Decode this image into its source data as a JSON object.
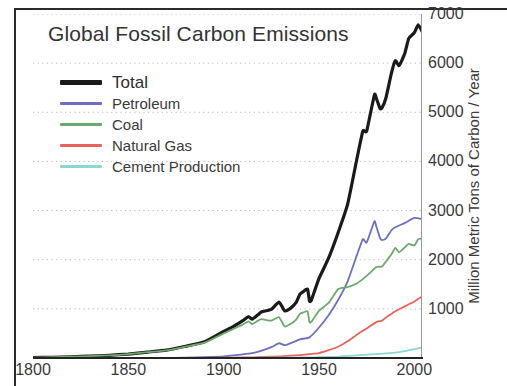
{
  "chart_data": {
    "type": "line",
    "title": "Global Fossil Carbon Emissions",
    "xlabel": "",
    "ylabel": "Million Metric Tons of Carbon / Year",
    "xlim": [
      1800,
      2004
    ],
    "ylim": [
      0,
      7000
    ],
    "xticks": [
      "1800",
      "1850",
      "1900",
      "1950",
      "2000"
    ],
    "xtick_values": [
      1800,
      1850,
      1900,
      1950,
      2000
    ],
    "yticks": [
      "1000",
      "2000",
      "3000",
      "4000",
      "5000",
      "6000",
      "7000"
    ],
    "ytick_values": [
      1000,
      2000,
      3000,
      4000,
      5000,
      6000,
      7000
    ],
    "grid": true,
    "grid_style": "dotted-horizontal",
    "yaxis_position": "right",
    "legend_position": "top-left",
    "series": [
      {
        "name": "Total",
        "color": "#1a1a1a",
        "width": 3.2,
        "x": [
          1800,
          1810,
          1820,
          1830,
          1840,
          1850,
          1860,
          1870,
          1880,
          1890,
          1900,
          1905,
          1910,
          1913,
          1915,
          1918,
          1920,
          1925,
          1929,
          1932,
          1935,
          1938,
          1940,
          1942,
          1944,
          1945,
          1946,
          1950,
          1955,
          1960,
          1965,
          1970,
          1973,
          1975,
          1979,
          1980,
          1982,
          1983,
          1985,
          1988,
          1990,
          1992,
          1995,
          1997,
          2000,
          2002,
          2004
        ],
        "y": [
          8,
          15,
          25,
          38,
          55,
          80,
          120,
          160,
          240,
          330,
          540,
          640,
          760,
          840,
          790,
          880,
          940,
          990,
          1140,
          960,
          1010,
          1130,
          1300,
          1360,
          1400,
          1160,
          1180,
          1620,
          2030,
          2550,
          3130,
          4080,
          4620,
          4620,
          5350,
          5290,
          5080,
          5090,
          5280,
          5800,
          6050,
          5950,
          6200,
          6500,
          6620,
          6780,
          6650
        ]
      },
      {
        "name": "Petroleum",
        "color": "#6f6fc0",
        "width": 1.8,
        "x": [
          1800,
          1850,
          1870,
          1880,
          1890,
          1900,
          1910,
          1915,
          1920,
          1925,
          1929,
          1932,
          1935,
          1940,
          1945,
          1950,
          1955,
          1960,
          1965,
          1970,
          1973,
          1975,
          1979,
          1980,
          1982,
          1983,
          1985,
          1988,
          1990,
          1995,
          2000,
          2004
        ],
        "y": [
          0,
          0,
          2,
          8,
          18,
          35,
          75,
          100,
          150,
          220,
          300,
          260,
          300,
          380,
          420,
          620,
          870,
          1180,
          1560,
          2110,
          2420,
          2350,
          2780,
          2680,
          2440,
          2400,
          2430,
          2600,
          2660,
          2750,
          2850,
          2830
        ]
      },
      {
        "name": "Coal",
        "color": "#6fa86f",
        "width": 1.8,
        "x": [
          1800,
          1820,
          1840,
          1850,
          1860,
          1870,
          1880,
          1890,
          1900,
          1905,
          1910,
          1913,
          1915,
          1918,
          1920,
          1925,
          1929,
          1932,
          1935,
          1938,
          1940,
          1942,
          1944,
          1945,
          1946,
          1950,
          1955,
          1960,
          1965,
          1970,
          1975,
          1980,
          1983,
          1985,
          1988,
          1990,
          1992,
          1995,
          1997,
          2000,
          2002,
          2004
        ],
        "y": [
          8,
          25,
          55,
          80,
          118,
          155,
          232,
          312,
          500,
          590,
          680,
          745,
          690,
          760,
          790,
          760,
          830,
          640,
          690,
          780,
          900,
          930,
          950,
          730,
          740,
          960,
          1120,
          1400,
          1440,
          1520,
          1670,
          1850,
          1860,
          1960,
          2110,
          2240,
          2150,
          2250,
          2320,
          2290,
          2420,
          2430
        ]
      },
      {
        "name": "Natural Gas",
        "color": "#e8645a",
        "width": 1.8,
        "x": [
          1800,
          1880,
          1890,
          1900,
          1910,
          1920,
          1930,
          1940,
          1945,
          1950,
          1955,
          1960,
          1965,
          1970,
          1975,
          1980,
          1983,
          1985,
          1988,
          1990,
          1995,
          2000,
          2004
        ],
        "y": [
          0,
          1,
          2,
          5,
          10,
          20,
          35,
          60,
          80,
          100,
          160,
          230,
          340,
          480,
          600,
          730,
          760,
          820,
          900,
          950,
          1050,
          1150,
          1250
        ]
      },
      {
        "name": "Cement Production",
        "color": "#8ad8d0",
        "width": 1.8,
        "x": [
          1800,
          1900,
          1920,
          1930,
          1940,
          1950,
          1960,
          1970,
          1980,
          1990,
          1995,
          2000,
          2004
        ],
        "y": [
          0,
          2,
          5,
          8,
          10,
          18,
          30,
          55,
          80,
          110,
          140,
          180,
          210
        ]
      }
    ]
  },
  "legend": {
    "items": [
      {
        "label": "Total",
        "color": "#1a1a1a"
      },
      {
        "label": "Petroleum",
        "color": "#6f6fc0"
      },
      {
        "label": "Coal",
        "color": "#6fa86f"
      },
      {
        "label": "Natural Gas",
        "color": "#e8645a"
      },
      {
        "label": "Cement Production",
        "color": "#8ad8d0"
      }
    ]
  }
}
